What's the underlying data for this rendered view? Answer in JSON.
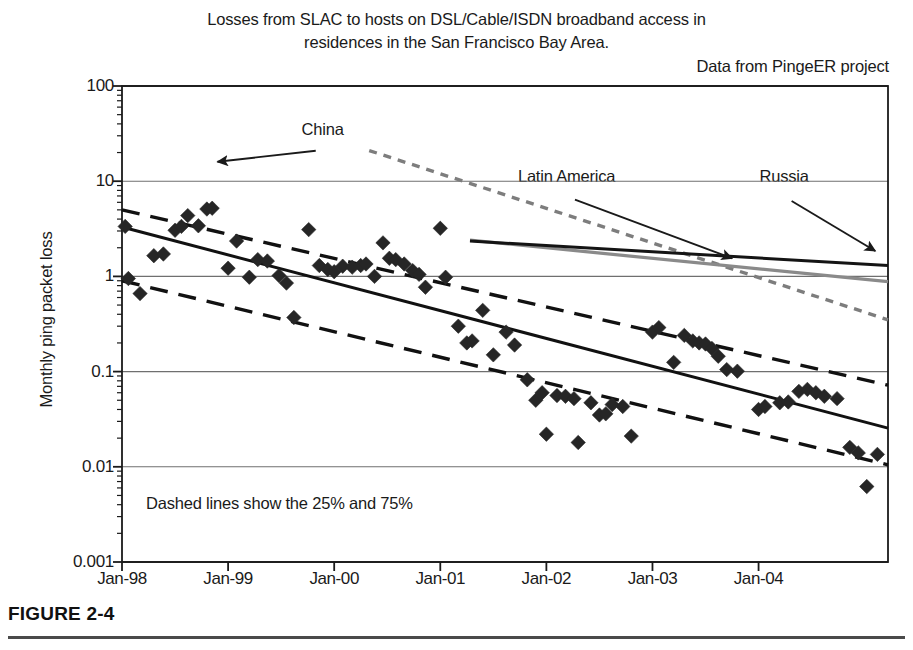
{
  "figure": {
    "caption": "FIGURE 2-4",
    "title_line1": "Losses from SLAC to hosts on DSL/Cable/ISDN broadband access in",
    "title_line2": "residences in the San Francisco Bay Area.",
    "source_note": "Data from PingeER project",
    "plot_note": "Dashed lines show the 25% and 75%"
  },
  "colors": {
    "axis": "#1a1a1a",
    "gridline": "#6f6f6f",
    "marker": "#262626",
    "median_line": "#111111",
    "quartile_line": "#111111",
    "china_line": "#7d7d7d",
    "latin_america_line": "#8a8a8a",
    "russia_line": "#141414",
    "caption_rule": "#4a4a4a",
    "background": "#ffffff"
  },
  "chart_data": {
    "type": "scatter",
    "title": "Losses from SLAC to hosts on DSL/Cable/ISDN broadband access in residences in the San Francisco Bay Area.",
    "subtitle": "Data from PingeER project",
    "xlabel": "",
    "ylabel": "Monthly ping packet loss",
    "yscale": "log",
    "ylim": [
      0.001,
      100
    ],
    "xlim": [
      "Jan-98",
      "Jul-05"
    ],
    "grid": true,
    "legend": "annotations-with-arrows",
    "y_ticks": [
      "100",
      "10",
      "1",
      "0.1",
      "0.01",
      "0.001"
    ],
    "y_tick_values": [
      100,
      10,
      1,
      0.1,
      0.01,
      0.001
    ],
    "x_ticks": [
      "Jan-98",
      "Jan-99",
      "Jan-00",
      "Jan-01",
      "Jan-02",
      "Jan-03",
      "Jan-04"
    ],
    "x_tick_values": [
      1998.0,
      1999.0,
      2000.0,
      2001.0,
      2002.0,
      2003.0,
      2004.0
    ],
    "annotations": [
      {
        "name": "china-annotation",
        "label": "China",
        "label_x": 1999.9,
        "label_y": 27.0,
        "arrow_to_x": 1998.9,
        "arrow_to_y": 16.0
      },
      {
        "name": "latin-america-annotation",
        "label": "Latin America",
        "label_x": 2002.2,
        "label_y": 8.6,
        "arrow_to_x": 2003.75,
        "arrow_to_y": 1.55
      },
      {
        "name": "russia-annotation",
        "label": "Russia",
        "label_x": 2004.25,
        "label_y": 8.6,
        "arrow_to_x": 2005.1,
        "arrow_to_y": 1.85
      }
    ],
    "series": [
      {
        "name": "Bay Area broadband hosts",
        "type": "scatter",
        "marker": "diamond",
        "points": [
          [
            1998.03,
            3.35
          ],
          [
            1998.06,
            0.95
          ],
          [
            1998.17,
            0.66
          ],
          [
            1998.3,
            1.65
          ],
          [
            1998.39,
            1.72
          ],
          [
            1998.5,
            3.05
          ],
          [
            1998.56,
            3.35
          ],
          [
            1998.62,
            4.35
          ],
          [
            1998.72,
            3.4
          ],
          [
            1998.8,
            5.1
          ],
          [
            1998.85,
            5.2
          ],
          [
            1999.0,
            1.22
          ],
          [
            1999.08,
            2.35
          ],
          [
            1999.2,
            0.98
          ],
          [
            1999.28,
            1.5
          ],
          [
            1999.37,
            1.45
          ],
          [
            1999.48,
            1.02
          ],
          [
            1999.55,
            0.85
          ],
          [
            1999.62,
            0.37
          ],
          [
            1999.76,
            3.1
          ],
          [
            1999.86,
            1.3
          ],
          [
            1999.94,
            1.18
          ],
          [
            2000.0,
            1.12
          ],
          [
            2000.08,
            1.28
          ],
          [
            2000.17,
            1.25
          ],
          [
            2000.25,
            1.3
          ],
          [
            2000.3,
            1.35
          ],
          [
            2000.38,
            1.0
          ],
          [
            2000.46,
            2.25
          ],
          [
            2000.52,
            1.55
          ],
          [
            2000.58,
            1.5
          ],
          [
            2000.66,
            1.35
          ],
          [
            2000.74,
            1.15
          ],
          [
            2000.8,
            1.05
          ],
          [
            2000.86,
            0.77
          ],
          [
            2001.0,
            3.2
          ],
          [
            2001.05,
            0.98
          ],
          [
            2001.17,
            0.3
          ],
          [
            2001.25,
            0.2
          ],
          [
            2001.3,
            0.21
          ],
          [
            2001.4,
            0.44
          ],
          [
            2001.5,
            0.15
          ],
          [
            2001.62,
            0.26
          ],
          [
            2001.7,
            0.19
          ],
          [
            2001.82,
            0.082
          ],
          [
            2001.9,
            0.05
          ],
          [
            2001.96,
            0.06
          ],
          [
            2002.0,
            0.022
          ],
          [
            2002.1,
            0.056
          ],
          [
            2002.18,
            0.055
          ],
          [
            2002.26,
            0.052
          ],
          [
            2002.3,
            0.018
          ],
          [
            2002.42,
            0.047
          ],
          [
            2002.5,
            0.035
          ],
          [
            2002.56,
            0.036
          ],
          [
            2002.62,
            0.045
          ],
          [
            2002.72,
            0.043
          ],
          [
            2002.8,
            0.021
          ],
          [
            2003.0,
            0.26
          ],
          [
            2003.06,
            0.29
          ],
          [
            2003.2,
            0.125
          ],
          [
            2003.3,
            0.24
          ],
          [
            2003.38,
            0.21
          ],
          [
            2003.44,
            0.2
          ],
          [
            2003.5,
            0.195
          ],
          [
            2003.56,
            0.175
          ],
          [
            2003.62,
            0.145
          ],
          [
            2003.7,
            0.105
          ],
          [
            2003.8,
            0.101
          ],
          [
            2004.0,
            0.04
          ],
          [
            2004.06,
            0.043
          ],
          [
            2004.2,
            0.047
          ],
          [
            2004.28,
            0.048
          ],
          [
            2004.38,
            0.062
          ],
          [
            2004.46,
            0.065
          ],
          [
            2004.54,
            0.06
          ],
          [
            2004.62,
            0.055
          ],
          [
            2004.74,
            0.052
          ],
          [
            2004.86,
            0.016
          ],
          [
            2004.94,
            0.014
          ],
          [
            2005.02,
            0.0062
          ],
          [
            2005.12,
            0.0135
          ]
        ]
      },
      {
        "name": "median-trend",
        "type": "line",
        "style": "solid",
        "from": [
          1998.0,
          3.3
        ],
        "to": [
          2005.22,
          0.0255
        ]
      },
      {
        "name": "upper-quartile-trend",
        "type": "line",
        "style": "dashed",
        "note": "75%",
        "from": [
          1998.0,
          5.0
        ],
        "to": [
          2005.22,
          0.072
        ]
      },
      {
        "name": "lower-quartile-trend",
        "type": "line",
        "style": "dashed",
        "note": "25%",
        "from": [
          1998.0,
          0.9
        ],
        "to": [
          2005.22,
          0.0105
        ]
      },
      {
        "name": "China",
        "type": "line",
        "style": "dotted",
        "from": [
          2000.33,
          21.0
        ],
        "to": [
          2005.22,
          0.35
        ]
      },
      {
        "name": "Latin America",
        "type": "line",
        "style": "solid",
        "from": [
          2001.28,
          2.4
        ],
        "to": [
          2005.22,
          0.88
        ]
      },
      {
        "name": "Russia",
        "type": "line",
        "style": "solid",
        "from": [
          2001.28,
          2.35
        ],
        "to": [
          2005.22,
          1.3
        ]
      }
    ]
  }
}
